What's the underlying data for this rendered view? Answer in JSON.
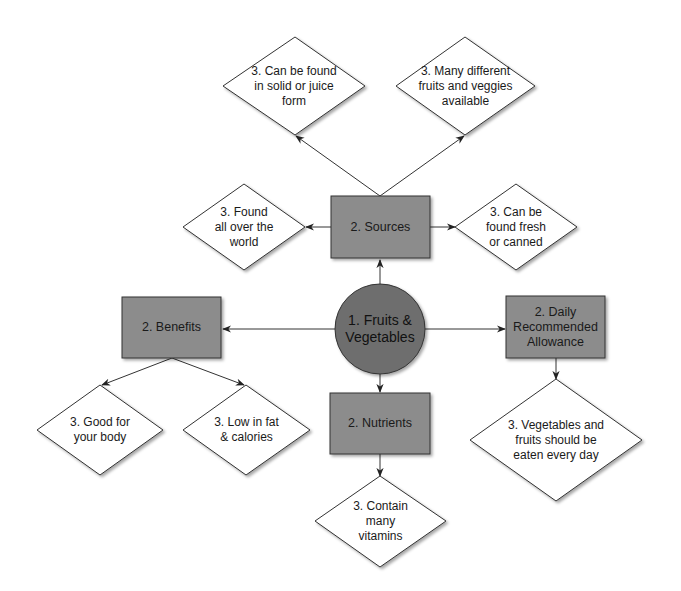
{
  "diagram": {
    "colors": {
      "box_fill": "#8c8c8c",
      "circle_fill": "#6e6e6e",
      "diamond_fill": "#ffffff",
      "stroke": "#333333",
      "edge": "#333333"
    },
    "center": {
      "id": "fruits-vegetables",
      "label": "1. Fruits &\nVegetables"
    },
    "level2": [
      {
        "id": "sources",
        "label": "2. Sources"
      },
      {
        "id": "benefits",
        "label": "2. Benefits"
      },
      {
        "id": "nutrients",
        "label": "2. Nutrients"
      },
      {
        "id": "daily-allowance",
        "label": "2. Daily\nRecommended\nAllowance"
      }
    ],
    "level3": [
      {
        "id": "solid-juice",
        "parent": "sources",
        "label": "3. Can be found\nin solid or juice\nform"
      },
      {
        "id": "many-different",
        "parent": "sources",
        "label": "3. Many different\nfruits and veggies\navailable"
      },
      {
        "id": "all-over-world",
        "parent": "sources",
        "label": "3. Found\nall over the\nworld"
      },
      {
        "id": "fresh-canned",
        "parent": "sources",
        "label": "3. Can be\nfound fresh\nor canned"
      },
      {
        "id": "good-for-body",
        "parent": "benefits",
        "label": "3. Good for\nyour body"
      },
      {
        "id": "low-fat",
        "parent": "benefits",
        "label": "3. Low in fat\n& calories"
      },
      {
        "id": "vitamins",
        "parent": "nutrients",
        "label": "3. Contain\nmany\nvitamins"
      },
      {
        "id": "every-day",
        "parent": "daily-allowance",
        "label": "3. Vegetables and\nfruits should be\neaten every day"
      }
    ]
  }
}
